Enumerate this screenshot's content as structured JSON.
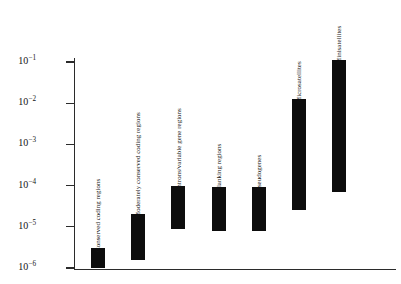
{
  "chart_data": {
    "type": "bar",
    "title": "",
    "subtitle": "",
    "xlabel": "",
    "ylabel": "Substitutions per locus per year",
    "scale": "log",
    "ylim": [
      1e-06,
      0.2
    ],
    "grid": false,
    "legend": null,
    "tick_labels": [
      "10−1",
      "10−2",
      "10−3",
      "10−4",
      "10−5",
      "10−6"
    ],
    "tick_values": [
      0.1,
      0.01,
      0.001,
      0.0001,
      1e-05,
      1e-06
    ],
    "tick_mantissas": [
      "10",
      "10",
      "10",
      "10",
      "10",
      "10"
    ],
    "tick_exponents": [
      "−1",
      "−2",
      "−3",
      "−4",
      "−5",
      "−6"
    ],
    "bar_style": "range-bars",
    "note": "Each bar spans the low-to-high substitution rate range for that sequence class.",
    "categories": [
      "Conserved coding regions",
      "Moderately conserved coding regions",
      "Introns/variable gene regions",
      "Flanking regions",
      "Pseudogenes",
      "Microsatellites",
      "Minisatellites"
    ],
    "ranges": [
      {
        "name": "Conserved coding regions",
        "low": 1e-06,
        "high": 3e-06
      },
      {
        "name": "Moderately conserved coding regions",
        "low": 1.6e-06,
        "high": 2e-05
      },
      {
        "name": "Introns/variable gene regions",
        "low": 9e-06,
        "high": 0.0001
      },
      {
        "name": "Flanking regions",
        "low": 8e-06,
        "high": 9e-05
      },
      {
        "name": "Pseudogenes",
        "low": 8e-06,
        "high": 9e-05
      },
      {
        "name": "Microsatellites",
        "low": 2.5e-05,
        "high": 0.013
      },
      {
        "name": "Minisatellites",
        "low": 7e-05,
        "high": 0.11
      }
    ],
    "colors": {
      "bar": "#0d0d0d",
      "axis": "#2b2b2b",
      "text": "#141414",
      "background": "#ffffff"
    }
  }
}
